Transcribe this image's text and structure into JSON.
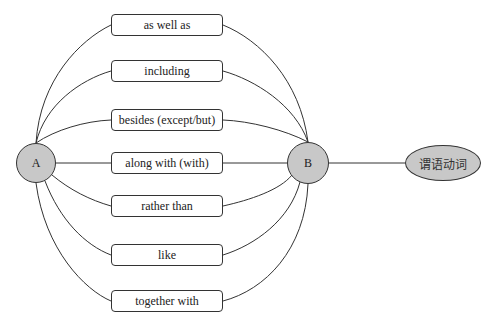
{
  "diagram": {
    "node_a": {
      "label": "A"
    },
    "node_b": {
      "label": "B"
    },
    "target": {
      "label": "谓语动词"
    },
    "connectors": [
      {
        "label": "as well as"
      },
      {
        "label": "including"
      },
      {
        "label": "besides (except/but)"
      },
      {
        "label": "along with (with)"
      },
      {
        "label": "rather than"
      },
      {
        "label": "like"
      },
      {
        "label": "together with"
      }
    ],
    "colors": {
      "node_fill": "#c8c8c8",
      "stroke": "#333333"
    }
  }
}
